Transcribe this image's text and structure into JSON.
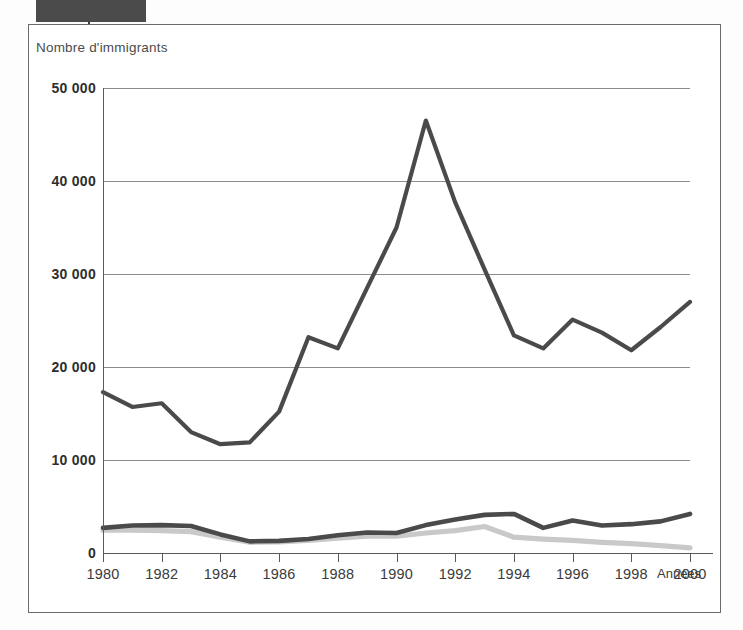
{
  "figure": {
    "tab_marker": "dark-tab",
    "frame": "bordered-figure"
  },
  "axis": {
    "y_caption": "Nombre d'immigrants",
    "x_caption": "Années",
    "y_ticks": [
      "0",
      "10 000",
      "20 000",
      "30 000",
      "40 000",
      "50 000"
    ],
    "x_ticks": [
      "1980",
      "1982",
      "1984",
      "1986",
      "1988",
      "1990",
      "1992",
      "1994",
      "1996",
      "1998",
      "2000"
    ]
  },
  "colors": {
    "line_main": "#4a4a4a",
    "line_secondary": "#4a4a4a",
    "line_light": "#c9c9c9",
    "grid": "#8c8c8c",
    "frame": "#6b6b6b",
    "tab": "#4b4b4b",
    "text": "#3a3a3a"
  },
  "chart_data": {
    "type": "line",
    "title": "",
    "xlabel": "Années",
    "ylabel": "Nombre d'immigrants",
    "xlim": [
      1980,
      2000
    ],
    "ylim": [
      0,
      50000
    ],
    "yticks": [
      0,
      10000,
      20000,
      30000,
      40000,
      50000
    ],
    "xticks": [
      1980,
      1982,
      1984,
      1986,
      1988,
      1990,
      1992,
      1994,
      1996,
      1998,
      2000
    ],
    "grid": true,
    "legend": "none",
    "x": [
      1980,
      1981,
      1982,
      1983,
      1984,
      1985,
      1986,
      1987,
      1988,
      1989,
      1990,
      1991,
      1992,
      1993,
      1994,
      1995,
      1996,
      1997,
      1998,
      1999,
      2000
    ],
    "series": [
      {
        "name": "serie-principale",
        "color": "#4a4a4a",
        "values": [
          17300,
          15700,
          16100,
          13000,
          11700,
          11900,
          15200,
          23200,
          22000,
          28500,
          35000,
          46500,
          37700,
          30500,
          23400,
          22000,
          25100,
          23700,
          21800,
          24300,
          27000
        ]
      },
      {
        "name": "serie-secondaire",
        "color": "#4a4a4a",
        "values": [
          2700,
          2950,
          3000,
          2900,
          2000,
          1250,
          1300,
          1500,
          1900,
          2200,
          2150,
          3000,
          3600,
          4100,
          4200,
          2700,
          3500,
          2950,
          3100,
          3400,
          4200
        ]
      },
      {
        "name": "serie-claire",
        "color": "#c9c9c9",
        "values": [
          2450,
          2450,
          2400,
          2300,
          1700,
          1150,
          1200,
          1350,
          1600,
          1800,
          1800,
          2150,
          2400,
          2850,
          1700,
          1500,
          1350,
          1150,
          1000,
          800,
          550
        ]
      }
    ]
  }
}
